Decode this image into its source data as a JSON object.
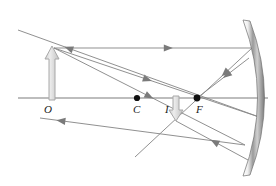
{
  "diagram": {
    "labels": [
      {
        "name": "object-point-label",
        "text": "O",
        "x": 44,
        "y": 104
      },
      {
        "name": "center-of-curvature-label",
        "text": "C",
        "x": 133,
        "y": 104
      },
      {
        "name": "image-point-label",
        "text": "I",
        "x": 165,
        "y": 104
      },
      {
        "name": "focal-point-label",
        "text": "F",
        "x": 196,
        "y": 104
      }
    ],
    "colors": {
      "ray": "#8a8a8a",
      "axis": "#7d7d7d",
      "object_arrow_fill": "#d9d9d9",
      "object_arrow_stroke": "#a8a8a8",
      "point_dot": "#111111",
      "mirror_light": "#ffffff",
      "mirror_mid": "#b5b5b5",
      "mirror_dark": "#6e6e6e",
      "label_text": "#1a1a1a"
    },
    "principal_axis": {
      "name": "principal-axis",
      "x1": 18,
      "y1": 98,
      "x2": 268,
      "y2": 98
    },
    "points": [
      {
        "name": "center-of-curvature-dot",
        "x": 137,
        "y": 98,
        "r": 3.1
      },
      {
        "name": "focal-point-dot",
        "x": 197,
        "y": 98,
        "r": 3.4
      }
    ],
    "object_arrow": {
      "name": "object-arrow",
      "x": 52,
      "base_y": 100,
      "tip_y": 46,
      "shaft_half_width": 3,
      "head_half_width": 7,
      "head_height": 13
    },
    "image_arrow": {
      "name": "image-arrow",
      "x": 176,
      "base_y": 96,
      "tip_y": 121,
      "shaft_half_width": 3,
      "head_half_width": 7,
      "head_height": 11
    },
    "rays": [
      {
        "name": "incident-parallel-ray",
        "description": "Parallel ray from object top to mirror",
        "x1": 54,
        "y1": 48,
        "x2": 252,
        "y2": 48,
        "arrow_at": 0.6
      },
      {
        "name": "reflected-through-focus-ray",
        "description": "Reflected ray from mirror through F to lower left",
        "x1": 252,
        "y1": 48,
        "x2": 135,
        "y2": 157,
        "arrow_at": 0.26
      },
      {
        "name": "incident-through-center-ray",
        "description": "Ray from object top through C to mirror",
        "x1": 54,
        "y1": 48,
        "x2": 262,
        "y2": 118,
        "arrow_at": 0.47
      },
      {
        "name": "reflected-back-through-center-ray",
        "description": "Reflected ray returning along line through C toward upper left",
        "x1": 262,
        "y1": 118,
        "x2": 18,
        "y2": 30,
        "arrow_at": 0.81
      },
      {
        "name": "incident-through-focus-ray",
        "description": "Ray from object top through F to mirror",
        "x1": 54,
        "y1": 48,
        "x2": 245,
        "y2": 145,
        "arrow_at": 0.52
      },
      {
        "name": "reflected-parallel-ray",
        "description": "Reflected parallel ray traveling left below axis",
        "x1": 245,
        "y1": 145,
        "x2": 40,
        "y2": 118,
        "arrow_at": 0.92
      },
      {
        "name": "reflected-ray-upper-mirror-to-focus",
        "description": "Upper mirror reflection heading down-left to F",
        "x1": 249,
        "y1": 58,
        "x2": 197,
        "y2": 98,
        "arrow_at": 0.5
      },
      {
        "name": "reflected-ray-lower-mirror-to-image",
        "description": "Lower mirror reflection heading up-left through image point",
        "x1": 248,
        "y1": 160,
        "x2": 176,
        "y2": 121,
        "arrow_at": 0.52
      }
    ],
    "mirror": {
      "name": "concave-mirror",
      "top_x": 243,
      "top_y": 20,
      "bottom_x": 243,
      "bottom_y": 176,
      "bulge_x": 272,
      "bulge_y": 98,
      "thickness": 7
    }
  }
}
